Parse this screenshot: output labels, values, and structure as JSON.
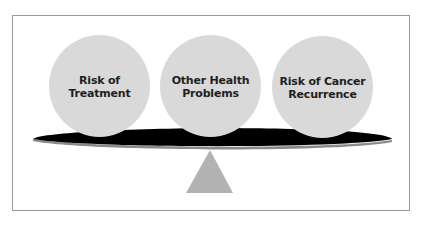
{
  "diagram": {
    "type": "balance-scale",
    "items": [
      {
        "label": "Risk of\nTreatment"
      },
      {
        "label": "Other Health\nProblems"
      },
      {
        "label": "Risk of Cancer\nRecurrence"
      }
    ],
    "colors": {
      "ball_fill": "#d9d9d9",
      "beam_fill": "#000000",
      "beam_edge": "#8a8a8a",
      "fulcrum_fill": "#b3b3b3",
      "frame_border": "#9a9a9a",
      "label_text": "#1f1f1f"
    }
  }
}
